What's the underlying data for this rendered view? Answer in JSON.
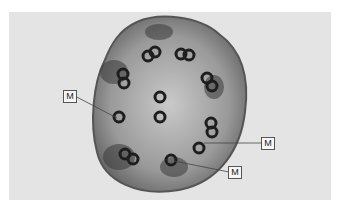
{
  "figure": {
    "labels": [
      {
        "text": "M",
        "target": "peripheral doublet (left)"
      },
      {
        "text": "M",
        "target": "peripheral doublet (right)"
      },
      {
        "text": "M",
        "target": "peripheral doublet (bottom)"
      }
    ],
    "colors": {
      "background": "#e4e4e4",
      "cell": "#8a8a8a",
      "microtubule": "#1e1e1e"
    }
  }
}
